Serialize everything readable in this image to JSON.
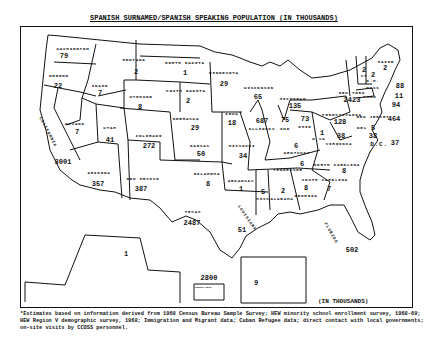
{
  "title": "SPANISH SURNAMED/SPANISH SPEAKING POPULATION (IN THOUSANDS)",
  "units_label": "(IN THOUSANDS)",
  "footnote": "*Estimates based on information derived from 1969 Census Bureau Sample Survey; HEW minority school enrollment survey, 1968-69; HEW Region V demographic survey, 1968; Immigration and Migrant data; Cuban Refugee data; direct contact with local governments; on-site visits by CCOSS personnel.",
  "states": [
    {
      "name": "WASHINGTON",
      "value": "79"
    },
    {
      "name": "OREGON",
      "value": "22"
    },
    {
      "name": "CALIFORNIA",
      "value": "3001"
    },
    {
      "name": "IDAHO",
      "value": "7"
    },
    {
      "name": "NEVADA",
      "value": "7"
    },
    {
      "name": "MONTANA",
      "value": "2"
    },
    {
      "name": "WYOMING",
      "value": "8"
    },
    {
      "name": "UTAH",
      "value": "41"
    },
    {
      "name": "COLORADO",
      "value": "272"
    },
    {
      "name": "ARIZONA",
      "value": "357"
    },
    {
      "name": "NEW MEXICO",
      "value": "387"
    },
    {
      "name": "NORTH DAKOTA",
      "value": "1"
    },
    {
      "name": "SOUTH DAKOTA",
      "value": "2"
    },
    {
      "name": "NEBRASKA",
      "value": "29"
    },
    {
      "name": "KANSAS",
      "value": "50"
    },
    {
      "name": "OKLAHOMA",
      "value": "8"
    },
    {
      "name": "TEXAS",
      "value": "2487"
    },
    {
      "name": "MINNESOTA",
      "value": "29"
    },
    {
      "name": "IOWA",
      "value": "18"
    },
    {
      "name": "MISSOURI",
      "value": "34"
    },
    {
      "name": "ARKANSAS",
      "value": "1"
    },
    {
      "name": "LOUISIANA",
      "value": "51"
    },
    {
      "name": "WISCONSIN",
      "value": "65"
    },
    {
      "name": "ILLINOIS",
      "value": "687"
    },
    {
      "name": "MICHIGAN",
      "value": "135"
    },
    {
      "name": "IND",
      "value": "75"
    },
    {
      "name": "OHIO",
      "value": "73"
    },
    {
      "name": "KENTUCKY",
      "value": "6"
    },
    {
      "name": "TENNESSEE",
      "value": "6"
    },
    {
      "name": "MISS",
      "value": "5"
    },
    {
      "name": "ALABAMA",
      "value": "2"
    },
    {
      "name": "GEORGIA",
      "value": "8"
    },
    {
      "name": "FLORIDA",
      "value": "502"
    },
    {
      "name": "SOUTH CAROLINA",
      "value": "7"
    },
    {
      "name": "NORTH CAROLINA",
      "value": "8"
    },
    {
      "name": "VIRGINIA",
      "value": "38"
    },
    {
      "name": "W VA",
      "value": "1"
    },
    {
      "name": "PENNSYLVANIA",
      "value": "128"
    },
    {
      "name": "NEW YORK",
      "value": "2423"
    },
    {
      "name": "VT",
      "value": "2"
    },
    {
      "name": "N.H.",
      "value": "2"
    },
    {
      "name": "MAINE",
      "value": "2"
    },
    {
      "name": "MASS",
      "value": "88"
    },
    {
      "name": "R.I.",
      "value": "11"
    },
    {
      "name": "CONN",
      "value": "94"
    },
    {
      "name": "NEW JERSEY",
      "value": "464"
    },
    {
      "name": "DEL",
      "value": "5"
    },
    {
      "name": "MD",
      "value": "38"
    },
    {
      "name": "D.C.",
      "value": "37"
    },
    {
      "name": "ALASKA",
      "value": "1"
    },
    {
      "name": "PUERTO RICO",
      "value": "2800"
    },
    {
      "name": "HAWAII",
      "value": "9"
    }
  ]
}
